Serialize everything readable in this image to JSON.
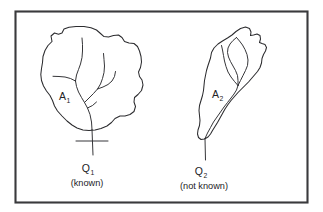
{
  "figure": {
    "background_color": "#ffffff",
    "frame": {
      "name": "figure-border",
      "stroke_color": "#3a3a3c"
    },
    "line_color": "#2b2b2e",
    "watersheds": [
      {
        "id": "left",
        "area_label": "A",
        "area_subscript": "1",
        "discharge_label": "Q",
        "discharge_subscript": "1",
        "caption": "(known)"
      },
      {
        "id": "right",
        "area_label": "A",
        "area_subscript": "2",
        "discharge_label": "Q",
        "discharge_subscript": "2",
        "caption": "(not known)"
      }
    ]
  }
}
